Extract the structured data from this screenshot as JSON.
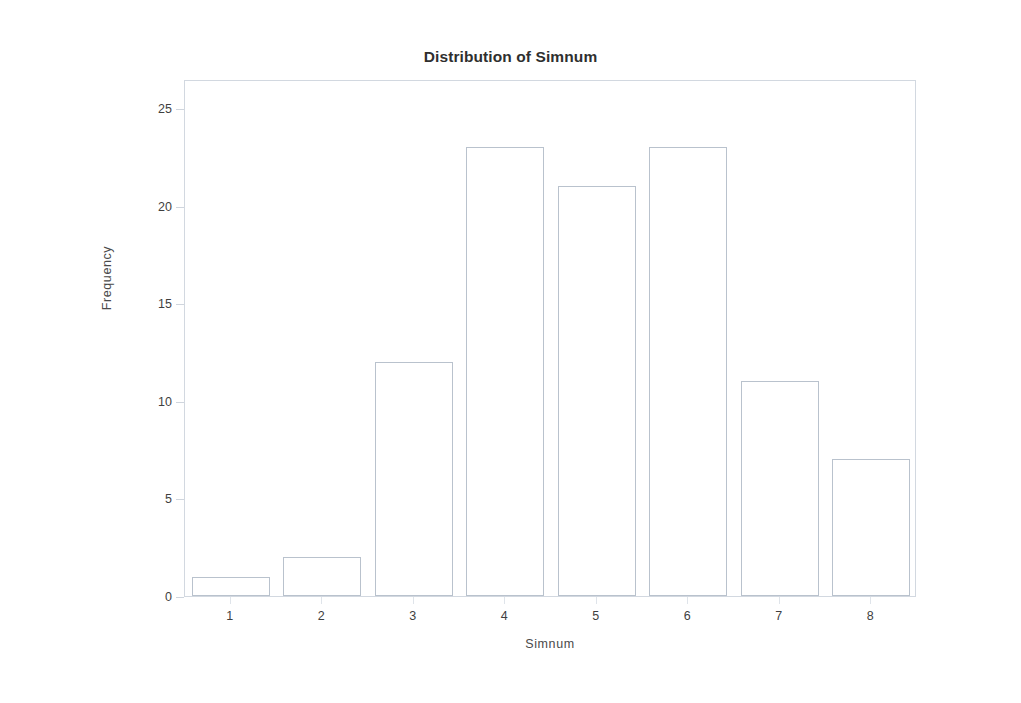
{
  "chart_data": {
    "type": "bar",
    "title": "Distribution of Simnum",
    "xlabel": "Simnum",
    "ylabel": "Frequency",
    "categories": [
      "1",
      "2",
      "3",
      "4",
      "5",
      "6",
      "7",
      "8"
    ],
    "values": [
      1,
      2,
      12,
      23,
      21,
      23,
      11,
      7
    ],
    "ylim": [
      0,
      26.5
    ],
    "yticks": [
      0,
      5,
      10,
      15,
      20,
      25
    ],
    "ytick_labels": [
      "0",
      "5",
      "10",
      "15",
      "20",
      "25"
    ],
    "xtick_labels": [
      "1",
      "2",
      "3",
      "4",
      "5",
      "6",
      "7",
      "8"
    ],
    "grid": false,
    "legend": null,
    "bar_fill_color": "#ffffff",
    "bar_border_color": "#b9c2cd",
    "frame_color": "#d2d8e0",
    "title_color": "#2f2f2f",
    "axis_text_color": "#3f3f3f",
    "page_border_color": "#555e6b"
  }
}
